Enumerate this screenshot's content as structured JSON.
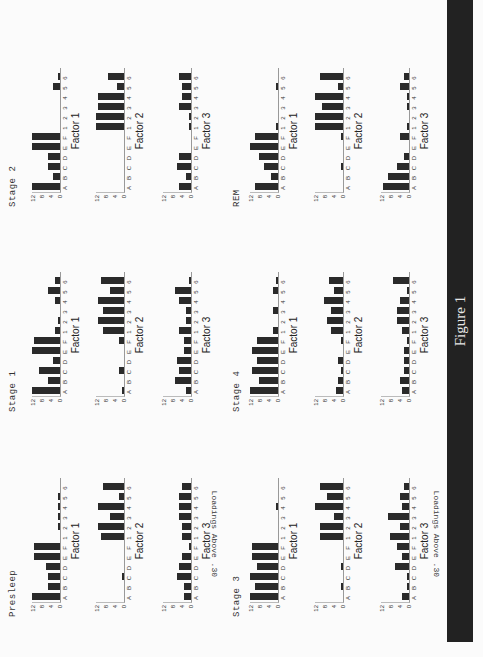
{
  "figure": {
    "caption": "Figure 1",
    "bar_color": "#222222"
  },
  "y_axis_title": "Loadings Above .30",
  "y_ticks": [
    "12",
    "8",
    "4",
    "0"
  ],
  "categories": [
    "A",
    "B",
    "C",
    "D",
    "E",
    "F",
    "1",
    "2",
    "3",
    "4",
    "5",
    "6"
  ],
  "chart_data": {
    "type": "bar",
    "title": "Figure 1",
    "ylabel": "Loadings Above .30",
    "xlabel": "",
    "ylim": [
      0,
      12
    ],
    "yticks": [
      0,
      4,
      8,
      12
    ],
    "grid": false,
    "categories": [
      "A",
      "B",
      "C",
      "D",
      "E",
      "F",
      "1",
      "2",
      "3",
      "4",
      "5",
      "6"
    ],
    "panels": [
      {
        "stage": "Presleep",
        "factor": "Factor 1",
        "values": [
          12,
          5,
          5,
          6,
          11,
          11,
          0,
          1,
          1,
          1,
          1,
          0
        ]
      },
      {
        "stage": "Presleep",
        "factor": "Factor 2",
        "values": [
          0,
          0,
          1,
          0,
          0,
          0,
          10,
          11,
          6,
          11,
          2,
          9
        ]
      },
      {
        "stage": "Presleep",
        "factor": "Factor 3",
        "values": [
          3,
          3,
          6,
          5,
          4,
          1,
          4,
          4,
          5,
          5,
          5,
          4
        ]
      },
      {
        "stage": "Stage 1",
        "factor": "Factor 1",
        "values": [
          12,
          5,
          9,
          3,
          12,
          11,
          2,
          1,
          0,
          2,
          5,
          2
        ]
      },
      {
        "stage": "Stage 1",
        "factor": "Factor 2",
        "values": [
          1,
          0,
          2,
          0,
          0,
          2,
          9,
          11,
          9,
          11,
          6,
          10
        ]
      },
      {
        "stage": "Stage 1",
        "factor": "Factor 3",
        "values": [
          2,
          7,
          5,
          6,
          3,
          3,
          5,
          2,
          2,
          5,
          7,
          1
        ]
      },
      {
        "stage": "Stage 2",
        "factor": "Factor 1",
        "values": [
          12,
          3,
          5,
          5,
          12,
          12,
          0,
          0,
          0,
          0,
          3,
          1
        ]
      },
      {
        "stage": "Stage 2",
        "factor": "Factor 2",
        "values": [
          0,
          0,
          0,
          0,
          0,
          0,
          12,
          12,
          11,
          11,
          3,
          7
        ]
      },
      {
        "stage": "Stage 2",
        "factor": "Factor 3",
        "values": [
          5,
          2,
          6,
          5,
          0,
          0,
          1,
          1,
          5,
          4,
          4,
          5
        ]
      },
      {
        "stage": "Stage 3",
        "factor": "Factor 1",
        "values": [
          12,
          10,
          12,
          9,
          11,
          11,
          0,
          0,
          0,
          1,
          0,
          0
        ]
      },
      {
        "stage": "Stage 3",
        "factor": "Factor 2",
        "values": [
          0,
          1,
          0,
          1,
          0,
          0,
          10,
          10,
          4,
          12,
          7,
          10
        ]
      },
      {
        "stage": "Stage 3",
        "factor": "Factor 3",
        "values": [
          3,
          1,
          1,
          6,
          3,
          5,
          8,
          4,
          9,
          3,
          4,
          2
        ]
      },
      {
        "stage": "Stage 4",
        "factor": "Factor 1",
        "values": [
          12,
          8,
          11,
          9,
          11,
          9,
          2,
          0,
          2,
          0,
          2,
          1
        ]
      },
      {
        "stage": "Stage 4",
        "factor": "Factor 2",
        "values": [
          3,
          2,
          1,
          2,
          0,
          1,
          5,
          7,
          5,
          8,
          4,
          6
        ]
      },
      {
        "stage": "Stage 4",
        "factor": "Factor 3",
        "values": [
          3,
          4,
          2,
          2,
          2,
          1,
          3,
          5,
          5,
          4,
          1,
          7
        ]
      },
      {
        "stage": "REM",
        "factor": "Factor 1",
        "values": [
          10,
          3,
          6,
          8,
          12,
          10,
          1,
          0,
          0,
          0,
          1,
          0
        ]
      },
      {
        "stage": "REM",
        "factor": "Factor 2",
        "values": [
          0,
          0,
          1,
          0,
          0,
          1,
          12,
          12,
          9,
          12,
          2,
          10
        ]
      },
      {
        "stage": "REM",
        "factor": "Factor 3",
        "values": [
          11,
          9,
          5,
          2,
          0,
          4,
          1,
          0,
          1,
          1,
          4,
          2
        ]
      }
    ]
  },
  "stages": [
    {
      "title": "Presleep",
      "u": 40,
      "v": 8,
      "panel_u": 38,
      "factors_v": [
        30,
        94,
        161
      ]
    },
    {
      "title": "Stage 1",
      "u": 245,
      "v": 8,
      "panel_u": 244,
      "factors_v": [
        30,
        94,
        161
      ]
    },
    {
      "title": "Stage 2",
      "u": 450,
      "v": 8,
      "panel_u": 448,
      "factors_v": [
        30,
        94,
        161
      ]
    },
    {
      "title": "Stage 3",
      "u": 40,
      "v": 232,
      "panel_u": 38,
      "factors_v": [
        248,
        313,
        379
      ]
    },
    {
      "title": "Stage 4",
      "u": 245,
      "v": 232,
      "panel_u": 244,
      "factors_v": [
        248,
        313,
        379
      ]
    },
    {
      "title": "REM",
      "u": 450,
      "v": 232,
      "panel_u": 448,
      "factors_v": [
        248,
        313,
        379
      ]
    }
  ],
  "y_axis_titles": [
    {
      "u": 80,
      "v": 210
    },
    {
      "u": 80,
      "v": 432
    }
  ]
}
